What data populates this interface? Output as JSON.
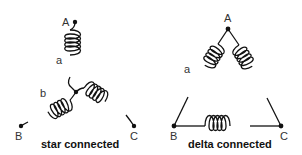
{
  "diagrams": [
    {
      "id": "star",
      "caption": "star connected",
      "terminals": [
        {
          "label": "A",
          "x": 75,
          "y": 22
        },
        {
          "label": "B",
          "x": 21,
          "y": 126
        },
        {
          "label": "C",
          "x": 134,
          "y": 126
        }
      ],
      "center": {
        "x": 76,
        "y": 92
      },
      "coil_labels": [
        {
          "label": "a",
          "x": 57,
          "y": 63
        },
        {
          "label": "b",
          "x": 40,
          "y": 96
        }
      ],
      "windings": 3
    },
    {
      "id": "delta",
      "caption": "delta connected",
      "terminals": [
        {
          "label": "A",
          "x": 228,
          "y": 29
        },
        {
          "label": "B",
          "x": 174,
          "y": 126
        },
        {
          "label": "C",
          "x": 281,
          "y": 126
        }
      ],
      "coil_labels": [
        {
          "label": "a",
          "x": 184,
          "y": 71
        }
      ],
      "windings": 3
    }
  ],
  "colors": {
    "line": "#111111",
    "text": "#333333",
    "background": "#ffffff"
  }
}
